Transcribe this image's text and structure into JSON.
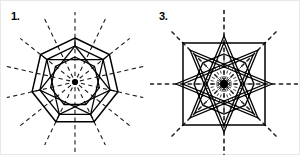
{
  "page": {
    "background_color": "#ffffff",
    "ink_color": "#000000",
    "border_color": "#e8e8e8",
    "width": 300,
    "height": 155
  },
  "figures": [
    {
      "id": "figure-1",
      "label": "1.",
      "shape_name": "regular-heptagon",
      "sides": 7,
      "order_of_rotational_symmetry": 7,
      "lines_of_symmetry": 7,
      "center": {
        "x": 74,
        "y": 81
      },
      "outer_radius": 44,
      "star_radius": 36,
      "inner_radius": 25,
      "ray_length": 70,
      "star_step": 2,
      "rotation_deg": -90,
      "center_dot_radius": 3.1,
      "stroke_color": "#000000",
      "dash_color": "#1a1a1a"
    },
    {
      "id": "figure-3",
      "label": "3.",
      "shape_name": "regular-octagram-star",
      "sides": 8,
      "order_of_rotational_symmetry": 8,
      "lines_of_symmetry": 8,
      "center": {
        "x": 75,
        "y": 83
      },
      "outer_radius": 48,
      "star_radius": 48,
      "square_radius": 41,
      "inner_radius": 30,
      "ray_length": 74,
      "star_step": 3,
      "rotation_deg": -90,
      "fine_ray_count": 24,
      "fine_ray_length": 27,
      "center_dot_radius": 4.2,
      "stroke_color": "#000000",
      "dash_color": "#1a1a1a"
    }
  ]
}
